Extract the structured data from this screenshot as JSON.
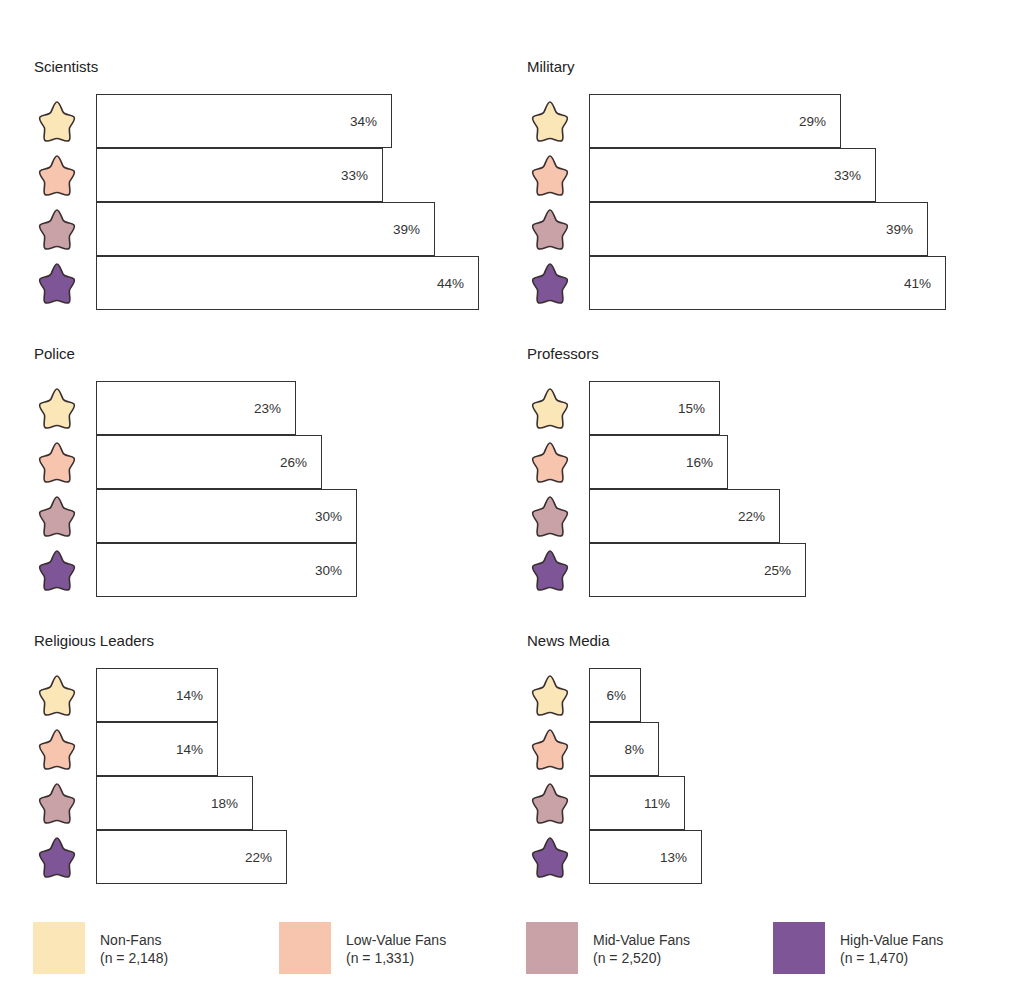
{
  "groups": [
    {
      "name": "Non-Fans",
      "n": "(n = 2,148)",
      "color": "#FBE6B8"
    },
    {
      "name": "Low-Value Fans",
      "n": "(n = 1,331)",
      "color": "#F7C4AE"
    },
    {
      "name": "Mid-Value Fans",
      "n": "(n = 2,520)",
      "color": "#C9A2A8"
    },
    {
      "name": "High-Value Fans",
      "n": "(n = 1,470)",
      "color": "#7E5596"
    }
  ],
  "panels": [
    {
      "title": "Scientists",
      "values": [
        34,
        33,
        39,
        44
      ],
      "labels": [
        "34%",
        "33%",
        "39%",
        "44%"
      ]
    },
    {
      "title": "Military",
      "values": [
        29,
        33,
        39,
        41
      ],
      "labels": [
        "29%",
        "33%",
        "39%",
        "41%"
      ]
    },
    {
      "title": "Police",
      "values": [
        23,
        26,
        30,
        30
      ],
      "labels": [
        "23%",
        "26%",
        "30%",
        "30%"
      ]
    },
    {
      "title": "Professors",
      "values": [
        15,
        16,
        22,
        25
      ],
      "labels": [
        "15%",
        "16%",
        "22%",
        "25%"
      ]
    },
    {
      "title": "Religious Leaders",
      "values": [
        14,
        14,
        18,
        22
      ],
      "labels": [
        "14%",
        "14%",
        "18%",
        "22%"
      ]
    },
    {
      "title": "News Media",
      "values": [
        6,
        8,
        11,
        13
      ],
      "labels": [
        "6%",
        "8%",
        "11%",
        "13%"
      ]
    }
  ],
  "chart_data": {
    "type": "bar",
    "orientation": "horizontal",
    "layout": "small multiples (3 rows x 2 columns)",
    "title": "",
    "categories": [
      "Scientists",
      "Military",
      "Police",
      "Professors",
      "Religious Leaders",
      "News Media"
    ],
    "series": [
      {
        "name": "Non-Fans (n = 2,148)",
        "color": "#FBE6B8",
        "values": [
          34,
          29,
          23,
          15,
          14,
          6
        ]
      },
      {
        "name": "Low-Value Fans (n = 1,331)",
        "color": "#F7C4AE",
        "values": [
          33,
          33,
          26,
          16,
          14,
          8
        ]
      },
      {
        "name": "Mid-Value Fans (n = 2,520)",
        "color": "#C9A2A8",
        "values": [
          39,
          39,
          30,
          22,
          18,
          11
        ]
      },
      {
        "name": "High-Value Fans (n = 1,470)",
        "color": "#7E5596",
        "values": [
          44,
          41,
          30,
          25,
          22,
          13
        ]
      }
    ],
    "value_format": "percent",
    "xlabel": "",
    "ylabel": "",
    "legend_position": "bottom",
    "grid": false,
    "xlim": [
      0,
      50
    ]
  }
}
